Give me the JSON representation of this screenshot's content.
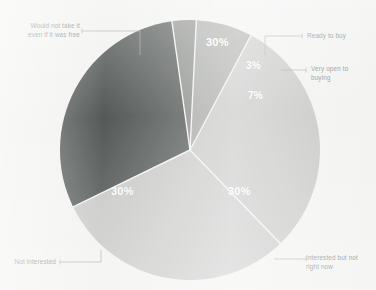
{
  "chart_data": {
    "type": "pie",
    "title": "",
    "subtitle": "",
    "xlabel": "",
    "ylabel": "",
    "legend_position": "callout-labels",
    "grid": false,
    "total": 100,
    "unit": "%",
    "categories": [
      "Ready to buy",
      "Very open to\nbuying",
      "Interested but not\nright now",
      "Not interested",
      "Would not take it\neven if it was free"
    ],
    "values": [
      3,
      7,
      30,
      30,
      30
    ],
    "value_labels": [
      "3%",
      "7%",
      "30%",
      "30%",
      "30%"
    ],
    "colors": [
      "#8a8d8a",
      "#a9aba8",
      "#c8c9c7",
      "#c9cac8",
      "#555a58"
    ],
    "slices": [
      {
        "name": "ready-to-buy",
        "label": "Ready to buy",
        "value": 3,
        "value_label": "3%",
        "color": "#8a8d8a",
        "start_angle_deg": -8,
        "end_angle_deg": 2.8,
        "label_x": 255,
        "label_y": 58,
        "callout_x": 300,
        "callout_y": 36
      },
      {
        "name": "very-open-to-buying",
        "label": "Very open to\nbuying",
        "value": 7,
        "value_label": "7%",
        "color": "#a9aba8",
        "start_angle_deg": 2.8,
        "end_angle_deg": 28,
        "label_x": 253,
        "label_y": 89,
        "callout_x": 304,
        "callout_y": 70
      },
      {
        "name": "interested-but-not-right-now",
        "label": "Interested but not\nright now",
        "value": 30,
        "value_label": "30%",
        "color": "#c8c9c7",
        "start_angle_deg": 28,
        "end_angle_deg": 136,
        "label_x": 242,
        "label_y": 192,
        "callout_x": 304,
        "callout_y": 259
      },
      {
        "name": "not-interested",
        "label": "Not interested",
        "value": 30,
        "value_label": "30%",
        "color": "#c9cac8",
        "start_angle_deg": 136,
        "end_angle_deg": 244,
        "label_x": 122,
        "label_y": 192,
        "callout_x": 44,
        "callout_y": 262
      },
      {
        "name": "would-not-take-it-even-if-free",
        "label": "Would not take it\neven if it was free",
        "value": 30,
        "value_label": "30%",
        "color": "#555a58",
        "start_angle_deg": 244,
        "end_angle_deg": 352,
        "label_x": 221,
        "label_y": 43,
        "callout_x": 22,
        "callout_y": 28
      }
    ],
    "geometry": {
      "center_x": 190,
      "center_y": 150,
      "radius": 130,
      "divider_color": "#f3f3f1",
      "divider_width": 1.4
    },
    "background_color": "#f3f3f1",
    "label_text_color": "#8c8e8c",
    "value_text_color": "#ffffff",
    "leader_line_color": "#a8aaa8"
  }
}
